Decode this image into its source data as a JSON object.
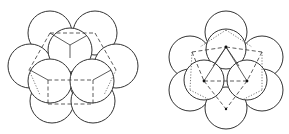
{
  "figures": [
    {
      "name": "left-packing",
      "description": "close-packed spheres, cubic view with tetrahedral void",
      "circle_radius": 22,
      "circles": [
        {
          "cx": 50,
          "cy": 33
        },
        {
          "cx": 95,
          "cy": 33
        },
        {
          "cx": 30,
          "cy": 66
        },
        {
          "cx": 116,
          "cy": 66
        },
        {
          "cx": 52,
          "cy": 101
        },
        {
          "cx": 93,
          "cy": 101
        },
        {
          "cx": 70,
          "cy": 50
        },
        {
          "cx": 50,
          "cy": 81
        },
        {
          "cx": 92,
          "cy": 81
        }
      ]
    },
    {
      "name": "right-packing",
      "description": "close-packed spheres, hexagonal view with octahedral arrangement",
      "circle_radius": 21,
      "circles": [
        {
          "cx": 226,
          "cy": 32
        },
        {
          "cx": 190,
          "cy": 57
        },
        {
          "cx": 262,
          "cy": 57
        },
        {
          "cx": 190,
          "cy": 90
        },
        {
          "cx": 262,
          "cy": 90
        },
        {
          "cx": 226,
          "cy": 108
        },
        {
          "cx": 226,
          "cy": 49
        },
        {
          "cx": 204,
          "cy": 80
        },
        {
          "cx": 247,
          "cy": 80
        }
      ]
    }
  ]
}
